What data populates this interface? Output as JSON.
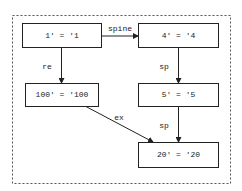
{
  "diagram": {
    "type": "graph",
    "nodes": [
      {
        "id": "n1",
        "label": "1' = '1"
      },
      {
        "id": "n4",
        "label": "4' = '4"
      },
      {
        "id": "n100",
        "label": "100' = '100"
      },
      {
        "id": "n5",
        "label": "5' = '5"
      },
      {
        "id": "n20",
        "label": "20' = '20"
      }
    ],
    "edges": [
      {
        "from": "n1",
        "to": "n4",
        "label": "spine"
      },
      {
        "from": "n1",
        "to": "n100",
        "label": "re"
      },
      {
        "from": "n4",
        "to": "n5",
        "label": "sp"
      },
      {
        "from": "n100",
        "to": "n20",
        "label": "ex"
      },
      {
        "from": "n5",
        "to": "n20",
        "label": "sp"
      }
    ]
  }
}
